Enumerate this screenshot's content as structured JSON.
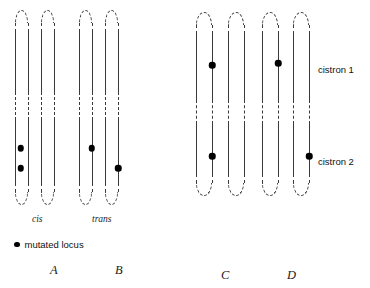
{
  "figure": {
    "type": "diagram",
    "legend": {
      "symbol": "filled-circle",
      "text": "mutated locus"
    },
    "side_labels": [
      {
        "name": "cistron-1",
        "text": "cistron 1",
        "x": 318,
        "y": 64
      },
      {
        "name": "cistron-2",
        "text": "cistron 2",
        "x": 318,
        "y": 156
      }
    ],
    "groups": [
      {
        "id": "A",
        "letter": "A",
        "letter_x": 50,
        "letter_y": 263,
        "arrangement_label": "cis",
        "arrangement_x": 32,
        "arrangement_y": 214,
        "top": 10,
        "bottom": 205,
        "break_top": 92,
        "break_bottom": 120,
        "chromosomes": [
          {
            "name": "chromosome-left",
            "x": 15,
            "width": 13
          },
          {
            "name": "chromosome-right",
            "x": 41,
            "width": 13
          }
        ],
        "loci": [
          {
            "name": "locus-a1",
            "x": 20.5,
            "y": 148
          },
          {
            "name": "locus-a2",
            "x": 20.5,
            "y": 168
          }
        ]
      },
      {
        "id": "B",
        "letter": "B",
        "letter_x": 115,
        "letter_y": 263,
        "arrangement_label": "trans",
        "arrangement_x": 92,
        "arrangement_y": 214,
        "top": 10,
        "bottom": 205,
        "break_top": 92,
        "break_bottom": 120,
        "chromosomes": [
          {
            "name": "chromosome-left",
            "x": 79,
            "width": 13
          },
          {
            "name": "chromosome-right",
            "x": 105,
            "width": 13
          }
        ],
        "loci": [
          {
            "name": "locus-b1",
            "x": 91.5,
            "y": 148
          },
          {
            "name": "locus-b2",
            "x": 118,
            "y": 168
          }
        ]
      },
      {
        "id": "C",
        "letter": "C",
        "letter_x": 221,
        "letter_y": 268,
        "arrangement_label": "",
        "arrangement_x": 0,
        "arrangement_y": 0,
        "top": 12,
        "bottom": 196,
        "break_top": 100,
        "break_bottom": 124,
        "chromosomes": [
          {
            "name": "chromosome-left",
            "x": 196,
            "width": 16
          },
          {
            "name": "chromosome-right",
            "x": 228,
            "width": 16
          }
        ],
        "loci": [
          {
            "name": "locus-c1",
            "x": 212,
            "y": 65
          },
          {
            "name": "locus-c2",
            "x": 212,
            "y": 156
          }
        ]
      },
      {
        "id": "D",
        "letter": "D",
        "letter_x": 287,
        "letter_y": 268,
        "arrangement_label": "",
        "arrangement_x": 0,
        "arrangement_y": 0,
        "top": 12,
        "bottom": 196,
        "break_top": 100,
        "break_bottom": 124,
        "chromosomes": [
          {
            "name": "chromosome-left",
            "x": 262,
            "width": 16
          },
          {
            "name": "chromosome-right",
            "x": 293,
            "width": 16
          }
        ],
        "loci": [
          {
            "name": "locus-d1",
            "x": 278,
            "y": 63
          },
          {
            "name": "locus-d2",
            "x": 309,
            "y": 156
          }
        ]
      }
    ],
    "legend_pos": {
      "x": 14,
      "y": 239
    },
    "colors": {
      "stroke": "#3a3a3a",
      "dot": "#000000",
      "background": "#ffffff",
      "text": "#111111"
    }
  }
}
